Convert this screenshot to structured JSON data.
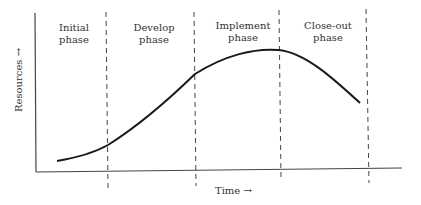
{
  "diagram": {
    "type": "project-lifecycle-resource-curve",
    "phases": [
      {
        "label": "Initial\nphase"
      },
      {
        "label": "Develop\nphase"
      },
      {
        "label": "Implement\nphase"
      },
      {
        "label": "Close-out\nphase"
      }
    ],
    "y_axis_label": "Resources →",
    "x_axis_label": "Time →",
    "colors": {
      "line": "#222222",
      "text": "#333333",
      "background": "#ffffff"
    }
  }
}
